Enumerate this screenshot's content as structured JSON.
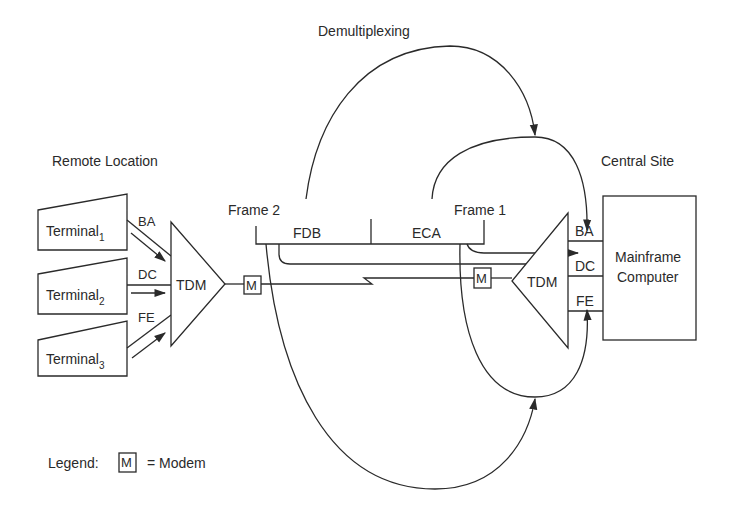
{
  "title": "Demultiplexing",
  "remote_site": {
    "label": "Remote Location",
    "terminals": [
      {
        "name": "Terminal",
        "sub": "1",
        "channel": "BA"
      },
      {
        "name": "Terminal",
        "sub": "2",
        "channel": "DC"
      },
      {
        "name": "Terminal",
        "sub": "3",
        "channel": "FE"
      }
    ],
    "mux_label": "TDM",
    "modem_label": "M"
  },
  "frames": {
    "frame2_label": "Frame 2",
    "frame1_label": "Frame 1",
    "segments": [
      "FDB",
      "ECA"
    ]
  },
  "central_site": {
    "label": "Central Site",
    "mux_label": "TDM",
    "modem_label": "M",
    "ports": [
      "BA",
      "DC",
      "FE"
    ],
    "computer_line1": "Mainframe",
    "computer_line2": "Computer"
  },
  "legend": {
    "prefix": "Legend:",
    "symbol": "M",
    "meaning": "= Modem"
  }
}
